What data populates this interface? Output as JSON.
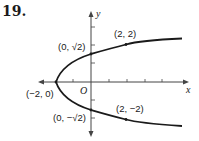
{
  "problem": {
    "number": "19."
  },
  "diagram": {
    "type": "parabola-graph",
    "equation_implied": "x = y^2 - 2",
    "axes": {
      "x_label": "x",
      "y_label": "y",
      "origin_label": "O"
    },
    "points": [
      {
        "label": "(2, 2)",
        "x": 2,
        "y": 2
      },
      {
        "label": "(0, √2)",
        "x": 0,
        "y": 1.414
      },
      {
        "label": "(−2, 0)",
        "x": -2,
        "y": 0
      },
      {
        "label": "(0, −√2)",
        "x": 0,
        "y": -1.414
      },
      {
        "label": "(2, −2)",
        "x": 2,
        "y": -2
      }
    ],
    "colors": {
      "curve": "#1a1a1a",
      "axis": "#444444"
    }
  }
}
